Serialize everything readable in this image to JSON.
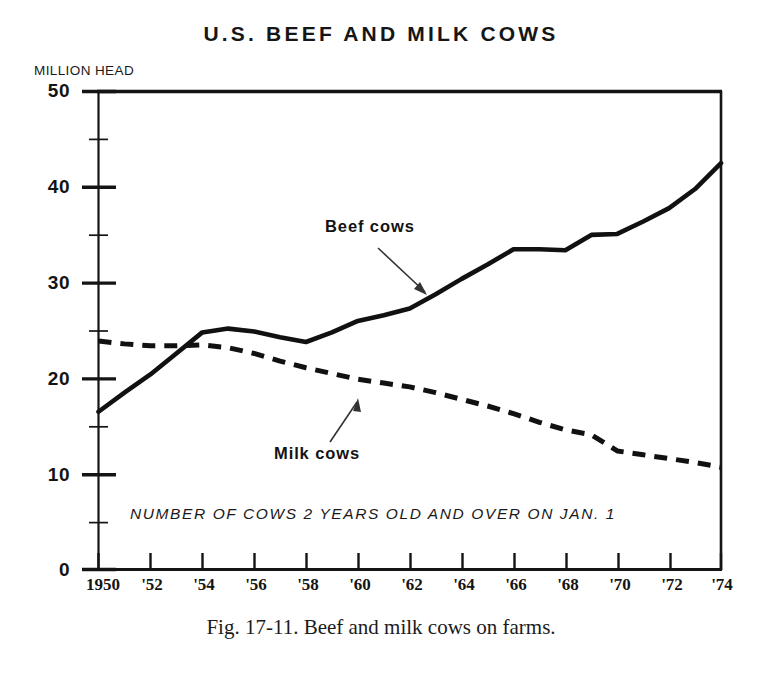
{
  "figure": {
    "title": "U.S. BEEF AND MILK COWS",
    "y_unit_label": "MILLION HEAD",
    "in_plot_note": "NUMBER OF COWS 2 YEARS OLD AND OVER ON JAN. 1",
    "caption": "Fig. 17-11. Beef and milk cows on farms.",
    "beef_label": "Beef cows",
    "milk_label": "Milk cows"
  },
  "chart_data": {
    "type": "line",
    "title": "U.S. BEEF AND MILK COWS",
    "subtitle": "NUMBER OF COWS 2 YEARS OLD AND OVER ON JAN. 1",
    "xlabel": "",
    "ylabel": "MILLION HEAD",
    "xlim": [
      1950,
      1974
    ],
    "ylim": [
      0,
      50
    ],
    "grid": false,
    "legend_position": "inline-annotations",
    "y_ticks": [
      0,
      10,
      20,
      30,
      40,
      50
    ],
    "y_tick_labels": [
      "0",
      "10",
      "20",
      "30",
      "40",
      "50"
    ],
    "y_minor_ticks": [
      5,
      15,
      25,
      35,
      45
    ],
    "x_ticks": [
      1950,
      1952,
      1954,
      1956,
      1958,
      1960,
      1962,
      1964,
      1966,
      1968,
      1970,
      1972,
      1974
    ],
    "x_tick_labels": [
      "1950",
      "'52",
      "'54",
      "'56",
      "'58",
      "'60",
      "'62",
      "'64",
      "'66",
      "'68",
      "'70",
      "'72",
      "'74"
    ],
    "x": [
      1950,
      1951,
      1952,
      1953,
      1954,
      1955,
      1956,
      1957,
      1958,
      1959,
      1960,
      1961,
      1962,
      1963,
      1964,
      1965,
      1966,
      1967,
      1968,
      1969,
      1970,
      1971,
      1972,
      1973,
      1974
    ],
    "series": [
      {
        "name": "Beef cows",
        "style": "solid",
        "color": "#111111",
        "values": [
          16.5,
          18.5,
          20.4,
          22.6,
          24.8,
          25.2,
          24.9,
          24.3,
          23.8,
          24.8,
          26.0,
          26.6,
          27.3,
          28.8,
          30.4,
          31.9,
          33.5,
          33.5,
          33.4,
          35.0,
          35.1,
          36.4,
          37.8,
          39.8,
          42.5
        ]
      },
      {
        "name": "Milk cows",
        "style": "dashed",
        "color": "#111111",
        "values": [
          23.9,
          23.6,
          23.4,
          23.4,
          23.5,
          23.2,
          22.6,
          21.8,
          21.1,
          20.5,
          19.9,
          19.5,
          19.1,
          18.5,
          17.8,
          17.1,
          16.3,
          15.4,
          14.6,
          14.1,
          12.4,
          12.0,
          11.6,
          11.2,
          10.7
        ]
      }
    ]
  }
}
